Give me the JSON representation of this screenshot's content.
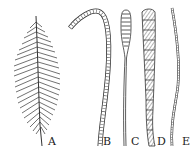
{
  "figure": {
    "panels": [
      {
        "id": "A",
        "label": "A",
        "shape": "feathery-plume"
      },
      {
        "id": "B",
        "label": "B",
        "shape": "curved-hook-segmented"
      },
      {
        "id": "C",
        "label": "C",
        "shape": "club-with-thin-stalk"
      },
      {
        "id": "D",
        "label": "D",
        "shape": "tapered-banded-strand"
      },
      {
        "id": "E",
        "label": "E",
        "shape": "thin-wavy-strand"
      }
    ],
    "colors": {
      "ink": "#222222",
      "background": "#ffffff"
    }
  }
}
